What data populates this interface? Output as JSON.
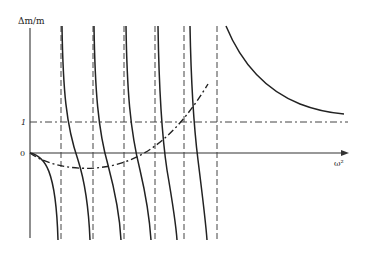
{
  "diagram": {
    "type": "resonance-curves",
    "y_axis_label": "Δm/m",
    "x_axis_label": "ω²",
    "tick_labels": {
      "zero": "0",
      "one": "1"
    },
    "origin_px": [
      30,
      153
    ],
    "unit_line_y_px": 122,
    "asymptotes_x_px": [
      61,
      93,
      124,
      155,
      184,
      217
    ],
    "branch_count": 7,
    "elements": [
      "vertical axis Δm/m",
      "horizontal axis ω² with arrow",
      "dash-dot horizontal reference line at 1",
      "six dashed vertical asymptotes",
      "six descending resonance branches between asymptotes",
      "final decaying branch right of last asymptote",
      "dash-dot parabola starting at origin"
    ]
  },
  "colors": {
    "ink": "#222222",
    "background": "#ffffff"
  }
}
